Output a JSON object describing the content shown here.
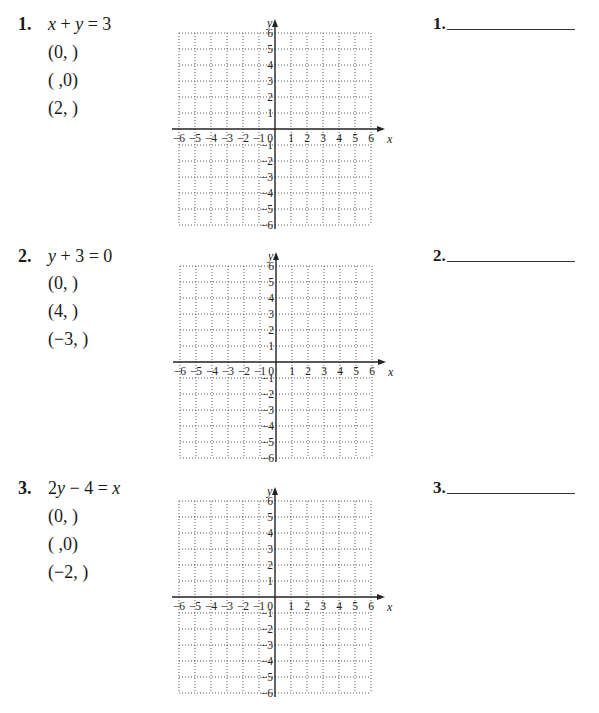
{
  "problems": [
    {
      "number": "1.",
      "equation": "x + y = 3",
      "points": [
        "(0,   )",
        "(   ,0)",
        "(2,   )"
      ],
      "answer_label": "1."
    },
    {
      "number": "2.",
      "equation": "y + 3 = 0",
      "points": [
        "(0,   )",
        "(4,   )",
        "(−3,   )"
      ],
      "answer_label": "2."
    },
    {
      "number": "3.",
      "equation": "2y − 4 = x",
      "points": [
        "(0,   )",
        "(   ,0)",
        "(−2,   )"
      ],
      "answer_label": "3."
    }
  ],
  "graph": {
    "x_label": "x",
    "y_label": "y",
    "x_ticks": [
      "−6",
      "−5",
      "−4",
      "−3",
      "−2",
      "−1",
      "0",
      "1",
      "2",
      "3",
      "4",
      "5",
      "6"
    ],
    "y_ticks_pos": [
      "1",
      "2",
      "3",
      "4",
      "5",
      "6"
    ],
    "y_ticks_neg": [
      "−1",
      "−2",
      "−3",
      "−4",
      "−5",
      "−6"
    ],
    "xlim": [
      -6,
      6
    ],
    "ylim": [
      -6,
      6
    ],
    "grid": "dotted"
  }
}
